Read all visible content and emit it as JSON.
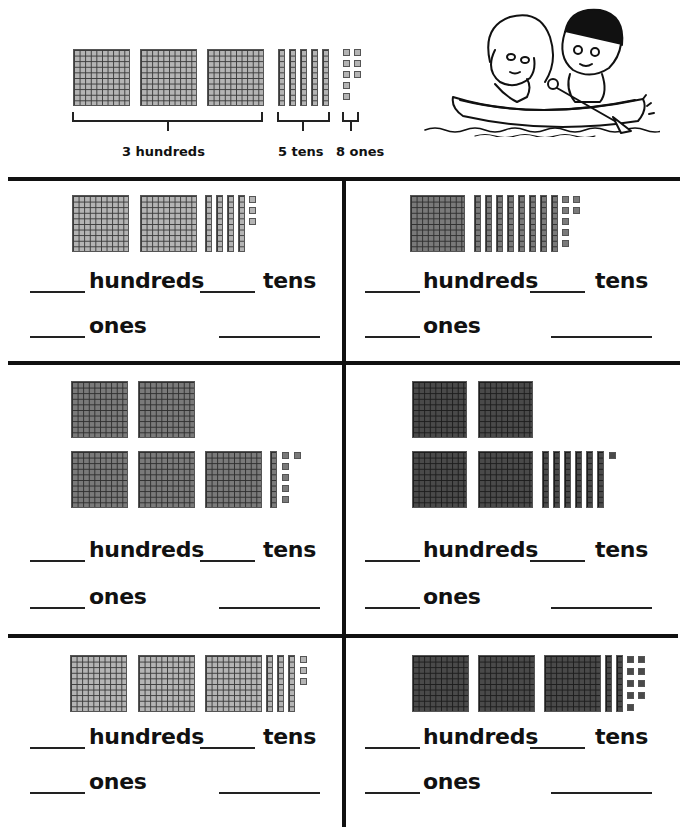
{
  "example": {
    "hundreds": 3,
    "tens": 5,
    "ones": 8,
    "hundreds_label": "3 hundreds",
    "tens_label": "5 tens",
    "ones_label": "8 ones"
  },
  "illustration": {
    "description": "Boy and girl paddling a canoe",
    "icon": "canoe-kids-illustration"
  },
  "labels": {
    "hundreds": "hundreds",
    "tens": "tens",
    "ones": "ones"
  },
  "problems": [
    {
      "id": 1,
      "hundreds": 2,
      "tens": 4,
      "ones": 3,
      "shade": "light"
    },
    {
      "id": 2,
      "hundreds": 1,
      "tens": 8,
      "ones": 7,
      "shade": "mid"
    },
    {
      "id": 3,
      "hundreds": 5,
      "tens": 1,
      "ones": 6,
      "shade": "mid"
    },
    {
      "id": 4,
      "hundreds": 4,
      "tens": 6,
      "ones": 1,
      "shade": "dark"
    },
    {
      "id": 5,
      "hundreds": 3,
      "tens": 3,
      "ones": 3,
      "shade": "light"
    },
    {
      "id": 6,
      "hundreds": 3,
      "tens": 2,
      "ones": 9,
      "shade": "dark"
    }
  ],
  "colors": {
    "light_block": "#b4b4b4",
    "mid_block": "#7a7a7a",
    "dark_block": "#4a4a4a",
    "rule": "#111111"
  }
}
